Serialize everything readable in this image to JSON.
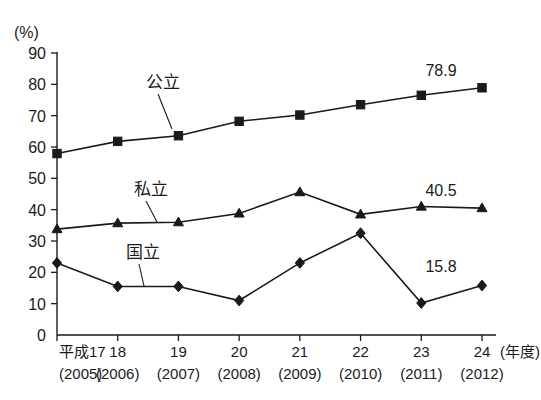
{
  "chart_data": {
    "type": "line",
    "title": "",
    "subtitle": "",
    "xlabel": "(年度)",
    "ylabel": "(%)",
    "ylim": [
      0,
      90
    ],
    "ytick_step": 10,
    "grid": false,
    "legend_position": "inline-annotation",
    "categories": [
      "平成17",
      "18",
      "19",
      "20",
      "21",
      "22",
      "23",
      "24"
    ],
    "categories_sub": [
      "(2005)",
      "(2006)",
      "(2007)",
      "(2008)",
      "(2009)",
      "(2010)",
      "(2011)",
      "(2012)"
    ],
    "ytick_labels": [
      "0",
      "10",
      "20",
      "30",
      "40",
      "50",
      "60",
      "70",
      "80",
      "90"
    ],
    "series": [
      {
        "name": "公立",
        "marker": "square",
        "values": [
          57.9,
          61.8,
          63.6,
          68.2,
          70.2,
          73.5,
          76.5,
          78.9
        ],
        "end_label": "78.9"
      },
      {
        "name": "私立",
        "marker": "triangle",
        "values": [
          33.8,
          35.7,
          36.0,
          38.8,
          45.6,
          38.5,
          41.0,
          40.5
        ],
        "end_label": "40.5"
      },
      {
        "name": "国立",
        "marker": "diamond",
        "values": [
          23.0,
          15.5,
          15.5,
          11.0,
          23.0,
          32.5,
          10.2,
          15.8
        ],
        "end_label": "15.8"
      }
    ],
    "annotations": [
      {
        "text": "公立",
        "series": "公立"
      },
      {
        "text": "私立",
        "series": "私立"
      },
      {
        "text": "国立",
        "series": "国立"
      }
    ],
    "colors": {
      "line": "#1a1a1a",
      "marker": "#1a1a1a",
      "axis": "#1a1a1a",
      "background": "#ffffff"
    }
  }
}
